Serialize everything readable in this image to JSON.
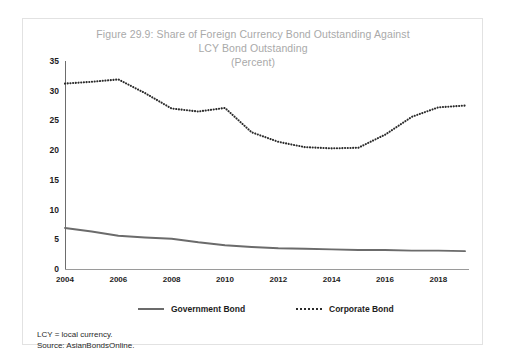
{
  "figure": {
    "title_line1": "Figure 29.9: Share of Foreign Currency Bond Outstanding Against",
    "title_line2": "LCY Bond Outstanding",
    "title_line3": "(Percent)",
    "notes": {
      "note1": "LCY = local currency.",
      "note2": "Source: AsianBondsOnline."
    },
    "colors": {
      "government_bond": "#6b6b6b",
      "corporate_bond": "#2b2b2b",
      "title_text": "#a9a9a9",
      "axis": "#6d6d6d",
      "card_border": "#e2e2e2"
    }
  },
  "chart_data": {
    "type": "line",
    "title": "Figure 29.9: Share of Foreign Currency Bond Outstanding Against LCY Bond Outstanding (Percent)",
    "xlabel": "",
    "ylabel": "Percent",
    "x": [
      2004,
      2005,
      2006,
      2007,
      2008,
      2009,
      2010,
      2011,
      2012,
      2013,
      2014,
      2015,
      2016,
      2017,
      2018,
      2019
    ],
    "xtick_labels": [
      "2004",
      "2006",
      "2008",
      "2010",
      "2012",
      "2014",
      "2016",
      "2018"
    ],
    "ytick_labels": [
      "0",
      "5",
      "10",
      "15",
      "20",
      "25",
      "30",
      "35"
    ],
    "ylim": [
      0,
      35
    ],
    "xlim": [
      2004,
      2019
    ],
    "grid": false,
    "legend_position": "bottom",
    "series": [
      {
        "name": "Government Bond",
        "style": "solid",
        "color": "#6b6b6b",
        "values": [
          6.9,
          6.3,
          5.6,
          5.3,
          5.1,
          4.5,
          4.0,
          3.7,
          3.5,
          3.4,
          3.3,
          3.2,
          3.2,
          3.1,
          3.1,
          3.0
        ]
      },
      {
        "name": "Corporate Bond",
        "style": "dotted",
        "color": "#2b2b2b",
        "values": [
          31.2,
          31.5,
          31.9,
          29.6,
          27.0,
          26.5,
          27.1,
          23.0,
          21.4,
          20.5,
          20.3,
          20.4,
          22.6,
          25.6,
          27.2,
          27.5
        ]
      }
    ]
  },
  "legend": {
    "items": [
      {
        "label": "Government Bond",
        "style": "solid"
      },
      {
        "label": "Corporate Bond",
        "style": "dotted"
      }
    ]
  }
}
